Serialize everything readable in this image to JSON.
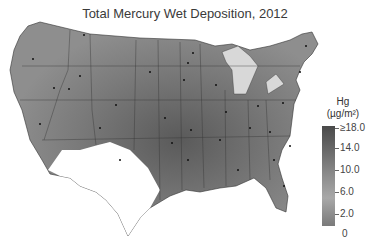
{
  "title": "Total Mercury Wet Deposition, 2012",
  "legend": {
    "title_line1": "Hg",
    "title_line2": "(µg/m²)",
    "ticks": [
      {
        "label": "≥18.0",
        "y": 126
      },
      {
        "label": "14.0",
        "y": 146
      },
      {
        "label": "10.0",
        "y": 168
      },
      {
        "label": "6.0",
        "y": 190
      },
      {
        "label": "2.0",
        "y": 212
      },
      {
        "label": "0",
        "y": 232
      }
    ],
    "colors": {
      "high": "#4a4a4a",
      "mid": "#8d8d8d",
      "low": "#a8a8a8",
      "no_data": "#ffffff"
    }
  },
  "map": {
    "region": "Contiguous United States",
    "year": "2012",
    "variable": "Total Mercury Wet Deposition",
    "units": "µg/m²",
    "no_data_region": "Southwest (southern Arizona, New Mexico, west Texas)",
    "features": [
      "state boundaries",
      "monitoring site dots",
      "Great Lakes"
    ]
  }
}
